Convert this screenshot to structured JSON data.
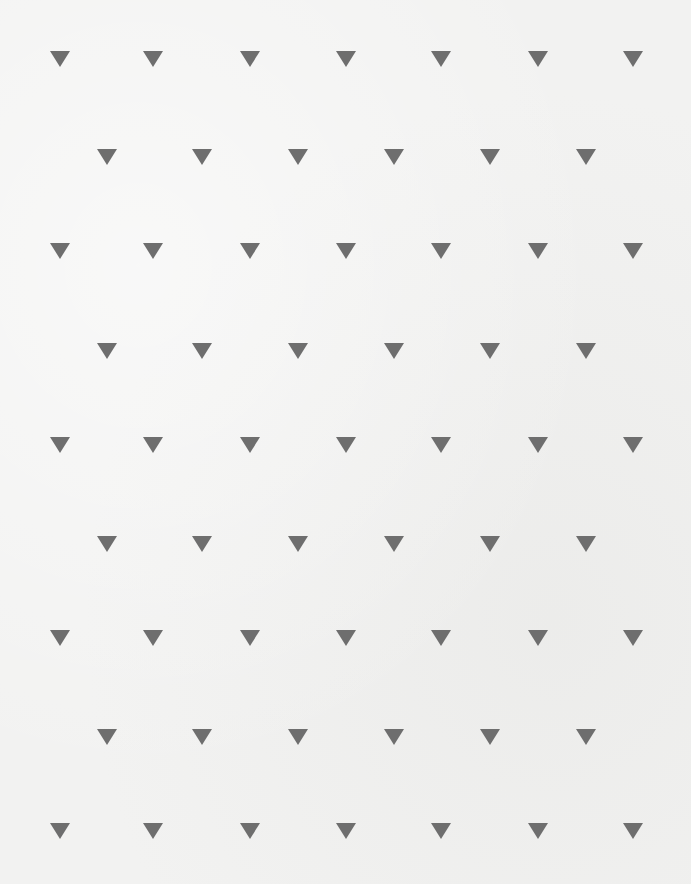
{
  "canvas": {
    "width": 691,
    "height": 884,
    "background": "#f2f2f1"
  },
  "pattern": {
    "shape": "triangle-down",
    "color": "#6e6e6e",
    "size": {
      "width": 20,
      "height": 16
    },
    "rows": [
      {
        "y": 59,
        "xs": [
          60,
          153,
          250,
          346,
          441,
          538,
          633
        ]
      },
      {
        "y": 157,
        "xs": [
          107,
          202,
          298,
          394,
          490,
          586
        ]
      },
      {
        "y": 251,
        "xs": [
          60,
          153,
          250,
          346,
          441,
          538,
          633
        ]
      },
      {
        "y": 351,
        "xs": [
          107,
          202,
          298,
          394,
          490,
          586
        ]
      },
      {
        "y": 445,
        "xs": [
          60,
          153,
          250,
          346,
          441,
          538,
          633
        ]
      },
      {
        "y": 544,
        "xs": [
          107,
          202,
          298,
          394,
          490,
          586
        ]
      },
      {
        "y": 638,
        "xs": [
          60,
          153,
          250,
          346,
          441,
          538,
          633
        ]
      },
      {
        "y": 737,
        "xs": [
          107,
          202,
          298,
          394,
          490,
          586
        ]
      },
      {
        "y": 831,
        "xs": [
          60,
          153,
          250,
          346,
          441,
          538,
          633
        ]
      }
    ]
  }
}
